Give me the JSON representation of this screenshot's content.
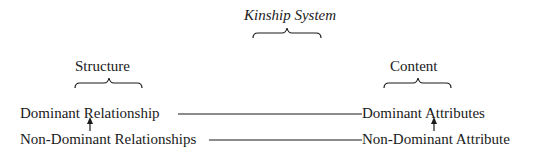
{
  "diagram": {
    "title": "Kinship System",
    "groups": {
      "structure": {
        "label": "Structure"
      },
      "content": {
        "label": "Content"
      }
    },
    "rows": [
      {
        "left": "Dominant Relationship",
        "right": "Dominant Attributes"
      },
      {
        "left": "Non-Dominant Relationships",
        "right": "Non-Dominant Attribute"
      }
    ],
    "arrows": [
      {
        "from": "Non-Dominant Relationships",
        "to": "Dominant Relationship",
        "icon": "arrow-up-icon"
      },
      {
        "from": "Non-Dominant Attribute",
        "to": "Dominant Attributes",
        "icon": "arrow-up-icon"
      }
    ],
    "connectors": [
      {
        "from": "Dominant Relationship",
        "to": "Dominant Attributes"
      },
      {
        "from": "Non-Dominant Relationships",
        "to": "Non-Dominant Attribute"
      }
    ]
  }
}
